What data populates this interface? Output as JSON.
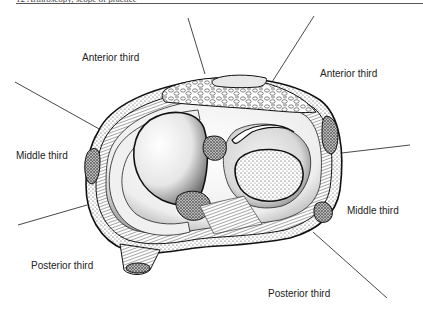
{
  "header": {
    "text": "12    Arthroscopy, scope of practice"
  },
  "labels": {
    "anterior_left": "Anterior third",
    "anterior_right": "Anterior third",
    "middle_left": "Middle third",
    "middle_right": "Middle third",
    "posterior_left": "Posterior third",
    "posterior_right": "Posterior third"
  },
  "figure": {
    "colors": {
      "ink": "#1a1a1a",
      "paper": "#ffffff",
      "shade": "#8a8a8a"
    }
  }
}
